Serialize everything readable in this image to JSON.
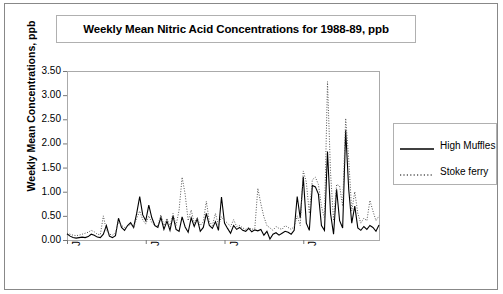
{
  "title": "Weekly Mean Nitric Acid Concentrations for 1988-89, ppb",
  "axes": {
    "ylabel": "Weekly Mean Concentrations, ppb",
    "yticks": [
      "3.50",
      "3.00",
      "2.50",
      "2.00",
      "1.50",
      "1.00",
      "0.50",
      "0.00"
    ],
    "xticks": [
      "Jan-88",
      "Jul-88",
      "Jan-89",
      "Jul-89"
    ]
  },
  "legend": {
    "items": [
      {
        "label": "High Muffles",
        "style": "solid",
        "color": "#000000"
      },
      {
        "label": "Stoke ferry",
        "style": "dotted",
        "color": "#000000"
      }
    ]
  },
  "chart_data": {
    "type": "line",
    "title": "Weekly Mean Nitric Acid Concentrations for 1988-89, ppb",
    "xlabel": "",
    "ylabel": "Weekly Mean Concentrations, ppb",
    "ylim": [
      0.0,
      3.5
    ],
    "ytick_values": [
      0.0,
      0.5,
      1.0,
      1.5,
      2.0,
      2.5,
      3.0,
      3.5
    ],
    "grid": false,
    "legend_position": "right",
    "x_tick_labels": [
      "Jan-88",
      "Jul-88",
      "Jan-89",
      "Jul-89"
    ],
    "x_tick_indices": [
      0,
      26,
      52,
      78
    ],
    "x_index_range": [
      0,
      103
    ],
    "series": [
      {
        "name": "High Muffles",
        "style": "solid",
        "color": "#000000",
        "values": [
          0.13,
          0.08,
          0.05,
          0.04,
          0.05,
          0.06,
          0.05,
          0.07,
          0.12,
          0.1,
          0.06,
          0.05,
          0.12,
          0.3,
          0.08,
          0.05,
          0.09,
          0.45,
          0.26,
          0.2,
          0.3,
          0.36,
          0.26,
          0.55,
          0.9,
          0.52,
          0.4,
          0.72,
          0.46,
          0.3,
          0.26,
          0.47,
          0.22,
          0.39,
          0.2,
          0.5,
          0.22,
          0.18,
          0.48,
          0.27,
          0.16,
          0.46,
          0.28,
          0.44,
          0.18,
          0.26,
          0.55,
          0.3,
          0.24,
          0.38,
          0.2,
          0.89,
          0.35,
          0.24,
          0.14,
          0.3,
          0.22,
          0.26,
          0.2,
          0.18,
          0.24,
          0.17,
          0.21,
          0.19,
          0.22,
          0.1,
          0.18,
          0.02,
          0.12,
          0.15,
          0.1,
          0.14,
          0.18,
          0.16,
          0.12,
          0.2,
          0.9,
          0.45,
          1.31,
          0.35,
          0.2,
          1.13,
          1.1,
          0.95,
          0.3,
          0.2,
          1.83,
          0.55,
          0.12,
          1.05,
          0.4,
          0.25,
          2.27,
          1.05,
          0.35,
          0.7,
          0.25,
          0.2,
          0.28,
          0.22,
          0.3,
          0.26,
          0.18,
          0.31
        ]
      },
      {
        "name": "Stoke ferry",
        "style": "dotted",
        "color": "#555555",
        "values": [
          0.14,
          0.12,
          0.1,
          0.09,
          0.1,
          0.12,
          0.14,
          0.16,
          0.2,
          0.17,
          0.12,
          0.11,
          0.5,
          0.2,
          0.12,
          0.1,
          0.15,
          0.38,
          0.3,
          0.26,
          0.28,
          0.33,
          0.25,
          0.45,
          0.6,
          0.42,
          0.33,
          0.5,
          0.36,
          0.3,
          0.3,
          0.52,
          0.3,
          0.45,
          0.28,
          0.55,
          0.3,
          0.62,
          1.3,
          0.95,
          0.4,
          0.62,
          0.35,
          0.46,
          0.3,
          0.38,
          0.8,
          0.38,
          0.3,
          0.55,
          0.3,
          0.48,
          0.4,
          0.35,
          0.28,
          0.42,
          0.28,
          0.3,
          0.25,
          0.22,
          0.26,
          0.22,
          0.24,
          1.07,
          0.75,
          0.48,
          0.3,
          0.25,
          0.2,
          0.28,
          0.24,
          0.22,
          0.3,
          0.26,
          0.22,
          0.28,
          0.5,
          0.3,
          1.43,
          1.2,
          0.55,
          1.25,
          1.3,
          1.15,
          0.7,
          0.45,
          3.28,
          1.4,
          0.4,
          1.15,
          1.12,
          0.7,
          2.52,
          1.68,
          0.6,
          1.0,
          0.55,
          0.35,
          0.45,
          0.4,
          0.82,
          0.6,
          0.4,
          0.5
        ]
      }
    ]
  }
}
